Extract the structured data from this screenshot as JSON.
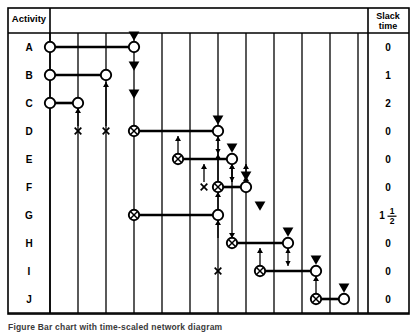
{
  "figure": {
    "kind": "project-schedule-bar-chart",
    "caption": "Figure  Bar chart with time-scaled network diagram",
    "frame": {
      "x": 8,
      "y": 8,
      "w": 401,
      "h": 306
    }
  },
  "columns": {
    "activity_header": "Activity",
    "slack_header_line1": "Slack",
    "slack_header_line2": "time",
    "activity_divider_x": 50,
    "slack_divider_x": 368
  },
  "grid": {
    "time_lines_x": [
      50,
      78,
      106,
      134,
      162,
      190,
      218,
      246,
      274,
      302,
      330,
      358
    ],
    "row_y": [
      47,
      75,
      103,
      131,
      159,
      187,
      215,
      243,
      271,
      299
    ],
    "top_y": 33,
    "bottom_y": 313
  },
  "icons": {
    "open_node": "open-circle-icon",
    "crossed_node": "crossed-circle-icon",
    "float_marker": "down-triangle-icon",
    "dependency_up": "up-arrow-icon",
    "dependency_double": "double-arrow-icon",
    "dummy_mark": "x-mark-icon"
  },
  "colors": {
    "ink": "#000000",
    "paper": "#ffffff",
    "caption": "#3a3a3a"
  },
  "chart_data": {
    "type": "bar",
    "title": "Bar chart with time-scaled network diagram",
    "xlabel": "",
    "ylabel": "Activity",
    "categories": [
      "A",
      "B",
      "C",
      "D",
      "E",
      "F",
      "G",
      "H",
      "I",
      "J"
    ],
    "series": [
      {
        "name": "Slack time",
        "values": [
          0,
          1,
          2,
          0,
          0,
          0,
          1.5,
          0,
          0,
          0
        ]
      }
    ],
    "slack_labels": [
      "0",
      "1",
      "2",
      "0",
      "0",
      "0",
      "1 1/2",
      "0",
      "0",
      "0"
    ],
    "grid": true,
    "legend": "none",
    "bars": [
      {
        "activity": "A",
        "start_x": 50,
        "end_x": 134,
        "start_node": "open",
        "end_node": "open",
        "row_y": 47
      },
      {
        "activity": "B",
        "start_x": 50,
        "end_x": 106,
        "start_node": "open",
        "end_node": "open",
        "row_y": 75
      },
      {
        "activity": "C",
        "start_x": 50,
        "end_x": 78,
        "start_node": "open",
        "end_node": "open",
        "row_y": 103
      },
      {
        "activity": "D",
        "start_x": 134,
        "end_x": 218,
        "start_node": "crossed",
        "end_node": "open",
        "row_y": 131
      },
      {
        "activity": "E",
        "start_x": 178,
        "end_x": 232,
        "start_node": "crossed",
        "end_node": "open",
        "row_y": 159
      },
      {
        "activity": "F",
        "start_x": 218,
        "end_x": 246,
        "start_node": "crossed",
        "end_node": "open",
        "row_y": 187
      },
      {
        "activity": "G",
        "start_x": 134,
        "end_x": 218,
        "start_node": "crossed",
        "end_node": "open",
        "row_y": 215
      },
      {
        "activity": "H",
        "start_x": 232,
        "end_x": 288,
        "start_node": "crossed",
        "end_node": "open",
        "row_y": 243
      },
      {
        "activity": "I",
        "start_x": 260,
        "end_x": 316,
        "start_node": "crossed",
        "end_node": "open",
        "row_y": 271
      },
      {
        "activity": "J",
        "start_x": 316,
        "end_x": 344,
        "start_node": "crossed",
        "end_node": "open",
        "row_y": 299
      }
    ],
    "float_markers": [
      {
        "x": 134,
        "y": 36
      },
      {
        "x": 134,
        "y": 66
      },
      {
        "x": 134,
        "y": 94
      },
      {
        "x": 218,
        "y": 120
      },
      {
        "x": 232,
        "y": 148
      },
      {
        "x": 246,
        "y": 176
      },
      {
        "x": 260,
        "y": 206
      },
      {
        "x": 288,
        "y": 232
      },
      {
        "x": 316,
        "y": 260
      },
      {
        "x": 344,
        "y": 288
      }
    ],
    "x_marks": [
      {
        "x": 78,
        "y": 131
      },
      {
        "x": 106,
        "y": 131
      },
      {
        "x": 204,
        "y": 187
      },
      {
        "x": 218,
        "y": 271
      }
    ],
    "up_arrows": [
      {
        "x": 78,
        "y_from": 126,
        "y_to": 108
      },
      {
        "x": 106,
        "y_from": 126,
        "y_to": 82
      },
      {
        "x": 178,
        "y_from": 154,
        "y_to": 136
      },
      {
        "x": 204,
        "y_from": 182,
        "y_to": 164
      },
      {
        "x": 218,
        "y_from": 210,
        "y_to": 192
      },
      {
        "x": 232,
        "y_from": 182,
        "y_to": 164
      },
      {
        "x": 246,
        "y_from": 182,
        "y_to": 164
      },
      {
        "x": 218,
        "y_from": 238,
        "y_to": 220
      },
      {
        "x": 260,
        "y_from": 266,
        "y_to": 248
      },
      {
        "x": 316,
        "y_from": 294,
        "y_to": 276
      }
    ],
    "double_arrows": [
      {
        "x": 218,
        "y_top": 136,
        "y_bottom": 154
      },
      {
        "x": 232,
        "y_top": 164,
        "y_bottom": 182
      },
      {
        "x": 288,
        "y_top": 248,
        "y_bottom": 266
      }
    ],
    "drop_lines": [
      {
        "x": 218,
        "y_from": 192,
        "y_to": 154
      },
      {
        "x": 232,
        "y_from": 164,
        "y_to": 238
      },
      {
        "x": 246,
        "y_from": 192,
        "y_to": 176
      }
    ]
  }
}
